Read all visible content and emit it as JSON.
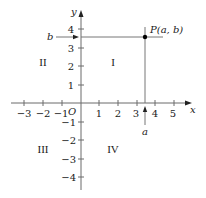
{
  "diagram": {
    "type": "cartesian-plane",
    "axes": {
      "x_label": "x",
      "y_label": "y",
      "origin_label": "O",
      "x_ticks": [
        {
          "value": -3,
          "label": "−3"
        },
        {
          "value": -2,
          "label": "−2"
        },
        {
          "value": -1,
          "label": "−1"
        },
        {
          "value": 1,
          "label": "1"
        },
        {
          "value": 2,
          "label": "2"
        },
        {
          "value": 3,
          "label": "3"
        },
        {
          "value": 4,
          "label": "4"
        },
        {
          "value": 5,
          "label": "5"
        }
      ],
      "y_ticks": [
        {
          "value": 4,
          "label": "4"
        },
        {
          "value": 3,
          "label": "3"
        },
        {
          "value": 2,
          "label": "2"
        },
        {
          "value": 1,
          "label": "1"
        },
        {
          "value": -1,
          "label": "−1"
        },
        {
          "value": -2,
          "label": "−2"
        },
        {
          "value": -3,
          "label": "−3"
        },
        {
          "value": -4,
          "label": "−4"
        }
      ]
    },
    "quadrants": {
      "I": "I",
      "II": "II",
      "III": "III",
      "IV": "IV"
    },
    "point": {
      "label": "P(a, b)",
      "x": 3.5,
      "y": 3.6
    },
    "projection_labels": {
      "a": "a",
      "b": "b"
    },
    "colors": {
      "axis": "#6b6b6b",
      "text": "#1a1a1a",
      "point": "#000000",
      "background": "#ffffff"
    }
  }
}
